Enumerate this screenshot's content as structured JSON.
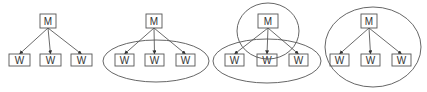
{
  "diagram": {
    "type": "master-worker-groupings",
    "colors": {
      "stroke": "#555555",
      "edge": "#444444",
      "text": "#333333",
      "background": "#ffffff"
    },
    "panels": [
      {
        "id": "panel-1",
        "master": {
          "label": "M",
          "x": 40,
          "y": 14,
          "w": 16,
          "h": 14
        },
        "workers": [
          {
            "label": "W",
            "x": 9,
            "y": 54,
            "w": 21,
            "h": 12
          },
          {
            "label": "W",
            "x": 40,
            "y": 54,
            "w": 21,
            "h": 12
          },
          {
            "label": "W",
            "x": 71,
            "y": 54,
            "w": 21,
            "h": 12
          }
        ],
        "ellipses": []
      },
      {
        "id": "panel-2",
        "master": {
          "label": "M",
          "x": 146,
          "y": 14,
          "w": 16,
          "h": 14
        },
        "workers": [
          {
            "label": "W",
            "x": 115,
            "y": 54,
            "w": 19,
            "h": 12
          },
          {
            "label": "W",
            "x": 145,
            "y": 54,
            "w": 19,
            "h": 12
          },
          {
            "label": "W",
            "x": 176,
            "y": 54,
            "w": 19,
            "h": 12
          }
        ],
        "ellipses": [
          {
            "cx": 156,
            "cy": 61,
            "rx": 53,
            "ry": 21
          }
        ]
      },
      {
        "id": "panel-3",
        "master": {
          "label": "M",
          "x": 258,
          "y": 14,
          "w": 20,
          "h": 14
        },
        "workers": [
          {
            "label": "W",
            "x": 225,
            "y": 54,
            "w": 19,
            "h": 12
          },
          {
            "label": "W",
            "x": 257,
            "y": 54,
            "w": 20,
            "h": 12
          },
          {
            "label": "W",
            "x": 289,
            "y": 54,
            "w": 19,
            "h": 12
          }
        ],
        "ellipses": [
          {
            "cx": 268,
            "cy": 31,
            "rx": 31,
            "ry": 28
          },
          {
            "cx": 267,
            "cy": 61,
            "rx": 54,
            "ry": 22
          }
        ]
      },
      {
        "id": "panel-4",
        "master": {
          "label": "M",
          "x": 361,
          "y": 14,
          "w": 16,
          "h": 14
        },
        "workers": [
          {
            "label": "W",
            "x": 330,
            "y": 54,
            "w": 19,
            "h": 12
          },
          {
            "label": "W",
            "x": 361,
            "y": 54,
            "w": 19,
            "h": 12
          },
          {
            "label": "W",
            "x": 392,
            "y": 54,
            "w": 19,
            "h": 12
          }
        ],
        "ellipses": [
          {
            "cx": 373,
            "cy": 47,
            "rx": 48,
            "ry": 40
          }
        ]
      }
    ]
  }
}
